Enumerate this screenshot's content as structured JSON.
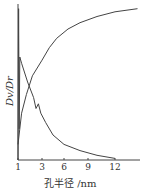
{
  "chart_data": {
    "type": "line",
    "title": "",
    "xlabel": "孔半径 /nm",
    "ylabel": "Dv/Dr",
    "x_ticks": [
      "1",
      "3",
      "6",
      "9",
      "12"
    ],
    "xlim": [
      1,
      15
    ],
    "ylim": [
      0,
      1
    ],
    "grid": false,
    "legend": null,
    "series": [
      {
        "name": "cumulative",
        "x": [
          1.0,
          1.3,
          1.7,
          2.2,
          3.0,
          4.0,
          5.0,
          6.5,
          8.0,
          10.0,
          12.0,
          14.5
        ],
        "values": [
          0.1,
          0.3,
          0.42,
          0.54,
          0.64,
          0.72,
          0.78,
          0.84,
          0.88,
          0.92,
          0.95,
          0.97
        ]
      },
      {
        "name": "distribution",
        "x": [
          1.0,
          1.05,
          1.1,
          1.15,
          1.3,
          1.8,
          2.3,
          2.5,
          2.7,
          2.9,
          3.5,
          4.5,
          6.0,
          8.0,
          10.0,
          12.0
        ],
        "values": [
          0.0,
          0.97,
          0.2,
          0.66,
          0.62,
          0.5,
          0.4,
          0.33,
          0.36,
          0.3,
          0.24,
          0.16,
          0.1,
          0.06,
          0.03,
          0.01
        ]
      }
    ]
  }
}
